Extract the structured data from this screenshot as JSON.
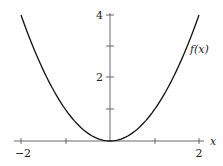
{
  "chart_data": {
    "type": "line",
    "title": "",
    "xlabel": "x",
    "ylabel": "",
    "xlim": [
      -2,
      2
    ],
    "ylim": [
      0,
      4
    ],
    "grid": false,
    "legend": null,
    "x_ticks": [
      -2,
      -1,
      0,
      1,
      2
    ],
    "x_tick_labels": [
      "−2",
      "",
      "",
      "",
      "2"
    ],
    "y_ticks": [
      1,
      2,
      3,
      4
    ],
    "y_tick_labels": [
      "",
      "2",
      "",
      "4"
    ],
    "series": [
      {
        "name": "f(x)",
        "function": "x^2",
        "x": [
          -2,
          -1.5,
          -1,
          -0.5,
          0,
          0.5,
          1,
          1.5,
          2
        ],
        "y": [
          4,
          2.25,
          1,
          0.25,
          0,
          0.25,
          1,
          2.25,
          4
        ]
      }
    ],
    "annotations": [
      {
        "text": "f(x)",
        "x": 1.85,
        "y": 3
      }
    ]
  },
  "labels": {
    "x_axis": "x",
    "x_min": "−2",
    "x_max": "2",
    "y_2": "2",
    "y_4": "4",
    "curve": "f(x)"
  }
}
